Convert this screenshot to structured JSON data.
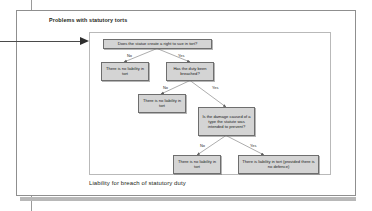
{
  "page": {
    "heading": "Problems with statutory torts",
    "caption": "Liability for breach of statutory duty",
    "colors": {
      "node_fill": "#d4d4d4",
      "node_border": "#6e6e6e",
      "frame_border": "#b9b9b9",
      "sheet_border": "#8f8f8f",
      "text": "#231f20",
      "connector": "#6a6a6a",
      "pointer": "#2e2e2e"
    }
  },
  "diagram": {
    "type": "decision-flowchart",
    "nodes": [
      {
        "id": "q1",
        "label": "Does the statue create a right to sue in tort?",
        "kind": "decision",
        "level": 0
      },
      {
        "id": "n1",
        "label": "There is no liability in tort",
        "kind": "outcome",
        "level": 1
      },
      {
        "id": "q2",
        "label": "Has the duty been breached?",
        "kind": "decision",
        "level": 1
      },
      {
        "id": "n2",
        "label": "There is no liability in tort",
        "kind": "outcome",
        "level": 2
      },
      {
        "id": "q3",
        "label": "Is the damage caused of a type the statute was intended to prevent?",
        "kind": "decision",
        "level": 2
      },
      {
        "id": "n3",
        "label": "There is no liability in tort",
        "kind": "outcome",
        "level": 3
      },
      {
        "id": "n4",
        "label": "There is liability in tort (provided there is no defence)",
        "kind": "outcome",
        "level": 3
      }
    ],
    "edges": [
      {
        "from": "q1",
        "to": "n1",
        "label": "No"
      },
      {
        "from": "q1",
        "to": "q2",
        "label": "Yes"
      },
      {
        "from": "q2",
        "to": "n2",
        "label": "No"
      },
      {
        "from": "q2",
        "to": "q3",
        "label": "Yes"
      },
      {
        "from": "q3",
        "to": "n3",
        "label": "No"
      },
      {
        "from": "q3",
        "to": "n4",
        "label": "Yes"
      }
    ],
    "edge_labels": {
      "l1_no": "No",
      "l1_yes": "Yes",
      "l2_no": "No",
      "l2_yes": "Yes",
      "l3_no": "No",
      "l3_yes": "Yes"
    }
  }
}
